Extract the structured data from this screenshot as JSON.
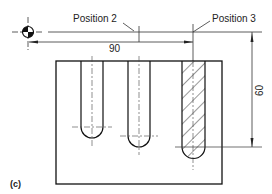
{
  "figure": {
    "label": "(c)",
    "labels": {
      "position2": "Position 2",
      "position3": "Position 3"
    },
    "dimensions": {
      "horizontal": "90",
      "vertical": "60"
    },
    "icons": [
      "datum-origin-icon"
    ],
    "colors": {
      "line": "#222222",
      "background": "#ffffff"
    }
  }
}
